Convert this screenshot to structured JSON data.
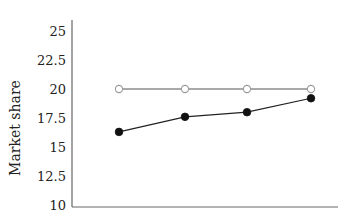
{
  "chart_data": {
    "type": "line",
    "title": "",
    "xlabel": "",
    "ylabel": "Market share",
    "ylim": [
      10,
      25
    ],
    "yticks": [
      10,
      12.5,
      15,
      17.5,
      20,
      22.5,
      25
    ],
    "ytick_labels": [
      "10",
      "12.5",
      "15",
      "17.5",
      "20",
      "22.5",
      "25"
    ],
    "x": [
      1,
      2,
      3,
      4
    ],
    "xtick_labels": [],
    "grid": false,
    "legend": null,
    "series": [
      {
        "name": "open-marker series",
        "marker": "open-circle",
        "color": "#777777",
        "values": [
          20,
          20,
          20,
          20
        ]
      },
      {
        "name": "filled-marker series",
        "marker": "filled-circle",
        "color": "#111111",
        "values": [
          16.3,
          17.6,
          18.0,
          19.2
        ]
      }
    ]
  },
  "layout": {
    "plot_left": 72,
    "plot_right": 338,
    "plot_top": 20,
    "plot_bottom": 207,
    "y_at_min": 205,
    "y_at_max": 31,
    "x_positions": [
      119,
      185,
      247,
      311
    ]
  }
}
